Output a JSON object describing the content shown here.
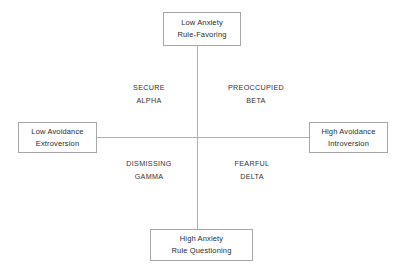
{
  "diagram": {
    "type": "two-axis-quadrant",
    "axes": {
      "vertical": {
        "top_anchor": {
          "line_1": "Low Anxiety",
          "line_2": "Rule-Favoring"
        },
        "bottom_anchor": {
          "line_1": "High Anxiety",
          "line_2": "Rule Questioning"
        }
      },
      "horizontal": {
        "left_anchor": {
          "line_1": "Low Avoidance",
          "line_2": "Extroversion"
        },
        "right_anchor": {
          "line_1": "High Avoidance",
          "line_2": "Introversion"
        }
      }
    },
    "quadrants": {
      "upper_left": {
        "name": "SECURE",
        "greek": "ALPHA"
      },
      "upper_right": {
        "name": "PREOCCUPIED",
        "greek": "BETA"
      },
      "lower_left": {
        "name": "DISMISSING",
        "greek": "GAMMA"
      },
      "lower_right": {
        "name": "FEARFUL",
        "greek": "DELTA"
      }
    },
    "colors": {
      "background": "#ffffff",
      "box_border": "#a6a6a6",
      "axis_line": "#b0b0b0",
      "text": "#2b2b2b",
      "quadrant_text": "#333333"
    }
  }
}
